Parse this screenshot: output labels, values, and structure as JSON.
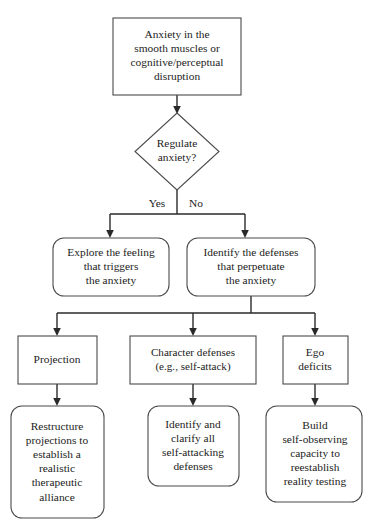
{
  "diagram": {
    "type": "flowchart",
    "title": "",
    "colors": {
      "background": "#ffffff",
      "node_stroke": "#4a4a4a",
      "node_fill": "#ffffff",
      "edge_stroke": "#2a2a2a",
      "text": "#1c1c1c"
    },
    "nodes": {
      "start": {
        "shape": "rectangle",
        "lines": [
          "Anxiety in the",
          "smooth muscles or",
          "cognitive/perceptual",
          "disruption"
        ]
      },
      "decision": {
        "shape": "diamond",
        "lines": [
          "Regulate",
          "anxiety?"
        ]
      },
      "explore": {
        "shape": "rounded-rectangle",
        "lines": [
          "Explore the feeling",
          "that triggers",
          "the anxiety"
        ]
      },
      "identify_defenses": {
        "shape": "rounded-rectangle",
        "lines": [
          "Identify the defenses",
          "that perpetuate",
          "the anxiety"
        ]
      },
      "projection": {
        "shape": "rectangle",
        "lines": [
          "Projection"
        ]
      },
      "character_defenses": {
        "shape": "rectangle",
        "lines": [
          "Character defenses",
          "(e.g., self-attack)"
        ]
      },
      "ego_deficits": {
        "shape": "rectangle",
        "lines": [
          "Ego",
          "deficits"
        ]
      },
      "restructure": {
        "shape": "rounded-rectangle",
        "lines": [
          "Restructure",
          "projections to",
          "establish a",
          "realistic",
          "therapeutic",
          "alliance"
        ]
      },
      "clarify": {
        "shape": "rounded-rectangle",
        "lines": [
          "Identify and",
          "clarify all",
          "self-attacking",
          "defenses"
        ]
      },
      "build_capacity": {
        "shape": "rounded-rectangle",
        "lines": [
          "Build",
          "self-observing",
          "capacity to",
          "reestablish",
          "reality testing"
        ]
      }
    },
    "edge_labels": {
      "yes": "Yes",
      "no": "No"
    }
  }
}
